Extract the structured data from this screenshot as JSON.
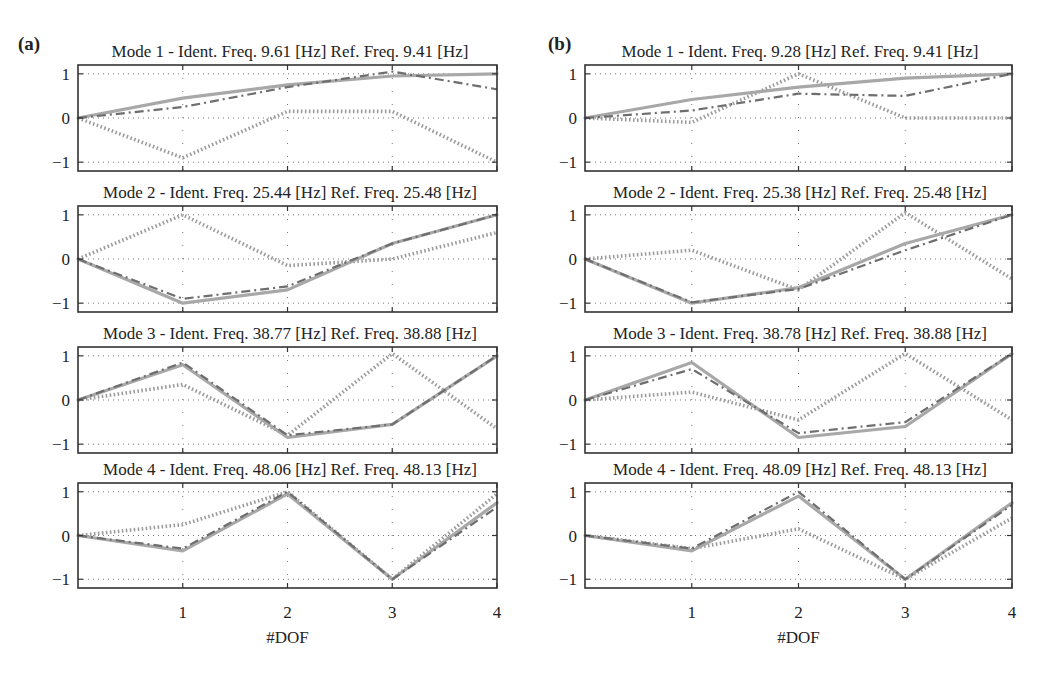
{
  "figure": {
    "panels": [
      {
        "label": "(a)",
        "xlabel": "#DOF"
      },
      {
        "label": "(b)",
        "xlabel": "#DOF"
      }
    ],
    "xticks": [
      "1",
      "2",
      "3",
      "4"
    ],
    "yticks": [
      "1",
      "0",
      "−1"
    ],
    "colors": {
      "solid": "#a8a8a8",
      "dashdot": "#6e6e6e",
      "dotted": "#9c9c9c",
      "axes": "#333333",
      "grid": "#555555"
    }
  },
  "chart_data": [
    {
      "type": "line",
      "panel": "(a)",
      "title": "Mode 1 - Ident. Freq. 9.61 [Hz] Ref. Freq. 9.41 [Hz]",
      "xlabel": "",
      "ylabel": "",
      "x": [
        0,
        1,
        2,
        3,
        4
      ],
      "xticks": [
        1,
        2,
        3,
        4
      ],
      "yticks": [
        -1,
        0,
        1
      ],
      "ylim": [
        -1.2,
        1.2
      ],
      "grid": true,
      "series": [
        {
          "name": "solid",
          "style": "solid",
          "values": [
            0,
            0.45,
            0.75,
            0.95,
            1.0
          ]
        },
        {
          "name": "dashdot",
          "style": "dashdot",
          "values": [
            0,
            0.25,
            0.7,
            1.05,
            0.65
          ]
        },
        {
          "name": "dotted",
          "style": "dotted",
          "values": [
            0,
            -0.9,
            0.15,
            0.15,
            -1.0
          ]
        }
      ]
    },
    {
      "type": "line",
      "panel": "(a)",
      "title": "Mode 2 - Ident. Freq. 25.44 [Hz] Ref. Freq. 25.48 [Hz]",
      "xlabel": "",
      "ylabel": "",
      "x": [
        0,
        1,
        2,
        3,
        4
      ],
      "xticks": [
        1,
        2,
        3,
        4
      ],
      "yticks": [
        -1,
        0,
        1
      ],
      "ylim": [
        -1.2,
        1.2
      ],
      "grid": true,
      "series": [
        {
          "name": "solid",
          "style": "solid",
          "values": [
            0,
            -1.0,
            -0.7,
            0.35,
            1.0
          ]
        },
        {
          "name": "dashdot",
          "style": "dashdot",
          "values": [
            0,
            -0.9,
            -0.62,
            0.35,
            1.0
          ]
        },
        {
          "name": "dotted",
          "style": "dotted",
          "values": [
            0,
            1.0,
            -0.15,
            0.0,
            0.6
          ]
        }
      ]
    },
    {
      "type": "line",
      "panel": "(a)",
      "title": "Mode 3 - Ident. Freq. 38.77 [Hz] Ref. Freq. 38.88 [Hz]",
      "xlabel": "",
      "ylabel": "",
      "x": [
        0,
        1,
        2,
        3,
        4
      ],
      "xticks": [
        1,
        2,
        3,
        4
      ],
      "yticks": [
        -1,
        0,
        1
      ],
      "ylim": [
        -1.2,
        1.2
      ],
      "grid": true,
      "series": [
        {
          "name": "solid",
          "style": "solid",
          "values": [
            0,
            0.8,
            -0.85,
            -0.55,
            1.0
          ]
        },
        {
          "name": "dashdot",
          "style": "dashdot",
          "values": [
            0,
            0.85,
            -0.8,
            -0.55,
            1.0
          ]
        },
        {
          "name": "dotted",
          "style": "dotted",
          "values": [
            0,
            0.35,
            -0.8,
            1.05,
            -0.65
          ]
        }
      ]
    },
    {
      "type": "line",
      "panel": "(a)",
      "title": "Mode 4 - Ident. Freq. 48.06 [Hz] Ref. Freq. 48.13 [Hz]",
      "xlabel": "#DOF",
      "ylabel": "",
      "x": [
        0,
        1,
        2,
        3,
        4
      ],
      "xticks": [
        1,
        2,
        3,
        4
      ],
      "yticks": [
        -1,
        0,
        1
      ],
      "ylim": [
        -1.2,
        1.2
      ],
      "grid": true,
      "series": [
        {
          "name": "solid",
          "style": "solid",
          "values": [
            0,
            -0.35,
            0.95,
            -1.0,
            0.75
          ]
        },
        {
          "name": "dashdot",
          "style": "dashdot",
          "values": [
            0,
            -0.3,
            1.0,
            -1.0,
            0.65
          ]
        },
        {
          "name": "dotted",
          "style": "dotted",
          "values": [
            0,
            0.25,
            1.0,
            -1.0,
            0.95
          ]
        }
      ]
    },
    {
      "type": "line",
      "panel": "(b)",
      "title": "Mode 1 - Ident. Freq. 9.28 [Hz] Ref. Freq. 9.41 [Hz]",
      "xlabel": "",
      "ylabel": "",
      "x": [
        0,
        1,
        2,
        3,
        4
      ],
      "xticks": [
        1,
        2,
        3,
        4
      ],
      "yticks": [
        -1,
        0,
        1
      ],
      "ylim": [
        -1.2,
        1.2
      ],
      "grid": true,
      "series": [
        {
          "name": "solid",
          "style": "solid",
          "values": [
            0,
            0.42,
            0.7,
            0.9,
            1.0
          ]
        },
        {
          "name": "dashdot",
          "style": "dashdot",
          "values": [
            0,
            0.17,
            0.55,
            0.5,
            1.0
          ]
        },
        {
          "name": "dotted",
          "style": "dotted",
          "values": [
            0,
            -0.1,
            1.0,
            0.0,
            0.0
          ]
        }
      ]
    },
    {
      "type": "line",
      "panel": "(b)",
      "title": "Mode 2 - Ident. Freq. 25.38 [Hz] Ref. Freq. 25.48 [Hz]",
      "xlabel": "",
      "ylabel": "",
      "x": [
        0,
        1,
        2,
        3,
        4
      ],
      "xticks": [
        1,
        2,
        3,
        4
      ],
      "yticks": [
        -1,
        0,
        1
      ],
      "ylim": [
        -1.2,
        1.2
      ],
      "grid": true,
      "series": [
        {
          "name": "solid",
          "style": "solid",
          "values": [
            0,
            -1.0,
            -0.65,
            0.35,
            1.0
          ]
        },
        {
          "name": "dashdot",
          "style": "dashdot",
          "values": [
            0,
            -0.98,
            -0.68,
            0.2,
            1.0
          ]
        },
        {
          "name": "dotted",
          "style": "dotted",
          "values": [
            0,
            0.2,
            -0.7,
            1.05,
            -0.45
          ]
        }
      ]
    },
    {
      "type": "line",
      "panel": "(b)",
      "title": "Mode 3 - Ident. Freq. 38.78 [Hz] Ref. Freq. 38.88 [Hz]",
      "xlabel": "",
      "ylabel": "",
      "x": [
        0,
        1,
        2,
        3,
        4
      ],
      "xticks": [
        1,
        2,
        3,
        4
      ],
      "yticks": [
        -1,
        0,
        1
      ],
      "ylim": [
        -1.2,
        1.2
      ],
      "grid": true,
      "series": [
        {
          "name": "solid",
          "style": "solid",
          "values": [
            0,
            0.85,
            -0.85,
            -0.6,
            1.05
          ]
        },
        {
          "name": "dashdot",
          "style": "dashdot",
          "values": [
            0,
            0.7,
            -0.75,
            -0.5,
            1.05
          ]
        },
        {
          "name": "dotted",
          "style": "dotted",
          "values": [
            0,
            0.18,
            -0.45,
            1.05,
            -0.45
          ]
        }
      ]
    },
    {
      "type": "line",
      "panel": "(b)",
      "title": "Mode 4 - Ident. Freq. 48.09 [Hz] Ref. Freq. 48.13 [Hz]",
      "xlabel": "#DOF",
      "ylabel": "",
      "x": [
        0,
        1,
        2,
        3,
        4
      ],
      "xticks": [
        1,
        2,
        3,
        4
      ],
      "yticks": [
        -1,
        0,
        1
      ],
      "ylim": [
        -1.2,
        1.2
      ],
      "grid": true,
      "series": [
        {
          "name": "solid",
          "style": "solid",
          "values": [
            0,
            -0.35,
            0.9,
            -1.0,
            0.75
          ]
        },
        {
          "name": "dashdot",
          "style": "dashdot",
          "values": [
            0,
            -0.3,
            1.0,
            -1.0,
            0.7
          ]
        },
        {
          "name": "dotted",
          "style": "dotted",
          "values": [
            0,
            -0.3,
            0.15,
            -1.0,
            0.4
          ]
        }
      ]
    }
  ]
}
